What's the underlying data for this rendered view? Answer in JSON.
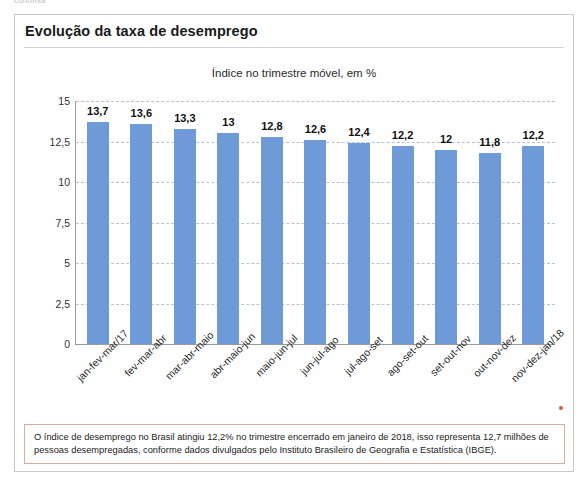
{
  "page": {
    "top_sliver_text": "conomia",
    "credit": "Paula Haydee Radi"
  },
  "figure": {
    "title": "Evolução da taxa de desemprego",
    "note": "O índice de desemprego no Brasil atingiu 12,2% no trimestre encerrado em janeiro de 2018, isso representa 12,7 milhões de pessoas desempregadas, conforme dados divulgados pelo Instituto Brasileiro de Geografia e Estatística (IBGE)."
  },
  "chart_data": {
    "type": "bar",
    "title": "Índice no trimestre móvel, em %",
    "subtitle": "",
    "xlabel": "",
    "ylabel": "",
    "ylim": [
      0,
      15
    ],
    "yticks": [
      0,
      2.5,
      5,
      7.5,
      10,
      12.5,
      15
    ],
    "ytick_labels": [
      "0",
      "2,5",
      "5",
      "7,5",
      "10",
      "12,5",
      "15"
    ],
    "grid": true,
    "legend": "none",
    "bar_color": "#6e9bd8",
    "categories": [
      "jan-fev-mar/17",
      "fev-mar-abr",
      "mar-abr-maio",
      "abr-maio-jun",
      "maio-jun-jul",
      "jun-jul-ago",
      "jul-ago-set",
      "ago-set-out",
      "set-out-nov",
      "out-nov-dez",
      "nov-dez-jan/18"
    ],
    "values": [
      13.7,
      13.6,
      13.3,
      13.0,
      12.8,
      12.6,
      12.4,
      12.2,
      12.0,
      11.8,
      12.2
    ],
    "value_labels": [
      "13,7",
      "13,6",
      "13,3",
      "13",
      "12,8",
      "12,6",
      "12,4",
      "12,2",
      "12",
      "11,8",
      "12,2"
    ]
  }
}
